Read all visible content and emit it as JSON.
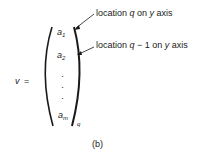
{
  "figure": {
    "vector_name": "v",
    "equals": "=",
    "caption": "(b)",
    "elements": [
      {
        "base": "a",
        "sub": "1"
      },
      {
        "base": "a",
        "sub": "2"
      },
      {
        "base": "a",
        "sub": "m"
      }
    ],
    "dots": [
      "·",
      "·",
      "·"
    ],
    "subscript_q": "q",
    "annotations": [
      {
        "prefix": "location ",
        "var": "q",
        "mid": "",
        "suffix": " on ",
        "axis": "y",
        "end": " axis"
      },
      {
        "prefix": "location ",
        "var": "q",
        "mid": " − 1",
        "suffix": " on ",
        "axis": "y",
        "end": " axis"
      }
    ]
  }
}
